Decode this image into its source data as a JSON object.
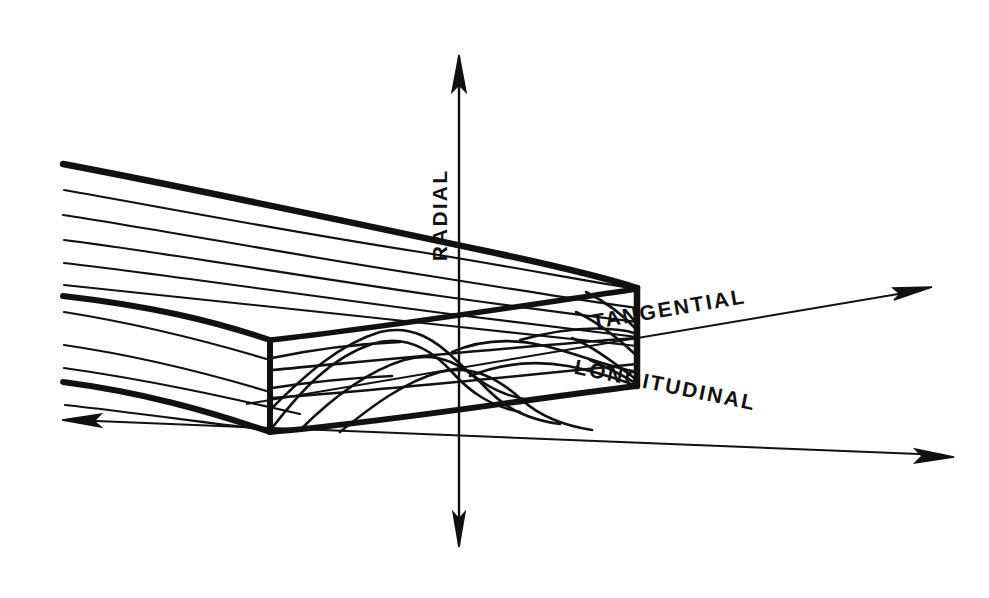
{
  "figure": {
    "background_color": "#ffffff",
    "ink_color": "#111111",
    "style": "hand-drawn pen sketch"
  },
  "axes": [
    {
      "id": "radial",
      "label": "RADIAL",
      "orientation": "vertical",
      "label_rotation_deg": -90,
      "arrowheads": "both",
      "from": {
        "x": 459,
        "y": 545
      },
      "to": {
        "x": 459,
        "y": 57
      },
      "label_x": 447,
      "label_y": 215
    },
    {
      "id": "tangential",
      "label": "TANGENTIAL",
      "orientation": "diagonal-up-right",
      "label_rotation_deg": -12,
      "arrowheads": "end",
      "from": {
        "x": 246,
        "y": 404
      },
      "to": {
        "x": 930,
        "y": 288
      },
      "label_x": 670,
      "label_y": 316
    },
    {
      "id": "longitudinal",
      "label": "LONGITUDINAL",
      "orientation": "diagonal-down-right",
      "label_rotation_deg": 13,
      "arrowheads": "both",
      "from": {
        "x": 66,
        "y": 421
      },
      "to": {
        "x": 952,
        "y": 457
      },
      "label_x": 660,
      "label_y": 392
    }
  ],
  "board": {
    "name": "sawn wood board",
    "face_front": "flat-sawn cathedral grain",
    "face_top": "straight longitudinal grain lines",
    "face_end": "end grain with growth rings",
    "grain_line_count_top": 11,
    "arch_count_front": 4
  },
  "colors": {
    "ink": "#111111",
    "background": "#ffffff"
  }
}
